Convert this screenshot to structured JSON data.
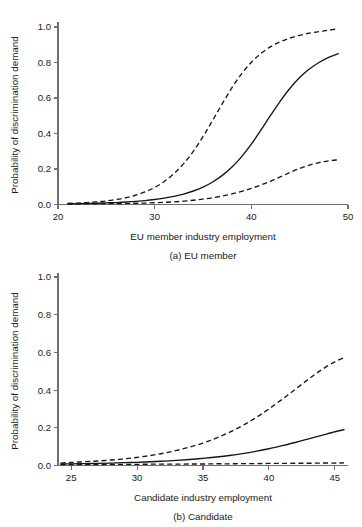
{
  "figure": {
    "panels": [
      {
        "id": "a",
        "subcaption": "(a) EU member",
        "xlabel": "EU member industry employment",
        "ylabel": "Probability of discrimination demand",
        "xticks": [
          "20",
          "30",
          "40",
          "50"
        ],
        "yticks": [
          "0.0",
          "0.2",
          "0.4",
          "0.6",
          "0.8",
          "1.0"
        ]
      },
      {
        "id": "b",
        "subcaption": "(b) Candidate",
        "xlabel": "Candidate industry employment",
        "ylabel": "Probability of discrimination demand",
        "xticks": [
          "25",
          "30",
          "35",
          "40",
          "45"
        ],
        "yticks": [
          "0.0",
          "0.2",
          "0.4",
          "0.6",
          "0.8",
          "1.0"
        ]
      }
    ],
    "footnote": ""
  },
  "chart_data": [
    {
      "type": "line",
      "panel": "a",
      "title": "(a) EU member",
      "xlabel": "EU member industry employment",
      "ylabel": "Probability of discrimination demand",
      "xlim": [
        20,
        50
      ],
      "ylim": [
        0.0,
        1.0
      ],
      "xticks": [
        20,
        30,
        40,
        50
      ],
      "yticks": [
        0.0,
        0.2,
        0.4,
        0.6,
        0.8,
        1.0
      ],
      "grid": false,
      "legend": null,
      "x": [
        21,
        22,
        23,
        24,
        25,
        26,
        27,
        28,
        29,
        30,
        31,
        32,
        33,
        34,
        35,
        36,
        37,
        38,
        39,
        40,
        41,
        42,
        43,
        44,
        45,
        46,
        47,
        48,
        49
      ],
      "series": [
        {
          "name": "Predicted probability",
          "style": "solid",
          "values": [
            0.004,
            0.005,
            0.006,
            0.007,
            0.009,
            0.011,
            0.014,
            0.018,
            0.022,
            0.028,
            0.036,
            0.046,
            0.059,
            0.076,
            0.098,
            0.127,
            0.164,
            0.211,
            0.27,
            0.34,
            0.42,
            0.503,
            0.583,
            0.655,
            0.715,
            0.763,
            0.8,
            0.829,
            0.85
          ]
        },
        {
          "name": "Upper 95% confidence bound",
          "style": "dashed",
          "values": [
            0.006,
            0.008,
            0.011,
            0.015,
            0.02,
            0.028,
            0.038,
            0.052,
            0.071,
            0.096,
            0.13,
            0.174,
            0.23,
            0.299,
            0.382,
            0.474,
            0.568,
            0.658,
            0.737,
            0.801,
            0.851,
            0.889,
            0.917,
            0.938,
            0.953,
            0.965,
            0.974,
            0.982,
            0.99
          ]
        },
        {
          "name": "Lower 95% confidence bound",
          "style": "dashed",
          "values": [
            0.003,
            0.003,
            0.004,
            0.004,
            0.005,
            0.005,
            0.006,
            0.007,
            0.008,
            0.01,
            0.012,
            0.015,
            0.019,
            0.024,
            0.03,
            0.038,
            0.048,
            0.06,
            0.074,
            0.091,
            0.11,
            0.132,
            0.156,
            0.18,
            0.203,
            0.222,
            0.236,
            0.246,
            0.252
          ]
        }
      ]
    },
    {
      "type": "line",
      "panel": "b",
      "title": "(b) Candidate",
      "xlabel": "Candidate industry employment",
      "ylabel": "Probability of discrimination demand",
      "xlim": [
        24,
        46
      ],
      "ylim": [
        0.0,
        1.0
      ],
      "xticks": [
        25,
        30,
        35,
        40,
        45
      ],
      "yticks": [
        0.0,
        0.2,
        0.4,
        0.6,
        0.8,
        1.0
      ],
      "grid": false,
      "legend": null,
      "x": [
        24.2,
        25,
        26,
        27,
        28,
        29,
        30,
        31,
        32,
        33,
        34,
        35,
        36,
        37,
        38,
        39,
        40,
        41,
        42,
        43,
        44,
        45,
        45.7
      ],
      "series": [
        {
          "name": "Predicted probability",
          "style": "solid",
          "values": [
            0.008,
            0.009,
            0.01,
            0.011,
            0.013,
            0.015,
            0.017,
            0.02,
            0.023,
            0.027,
            0.032,
            0.038,
            0.045,
            0.053,
            0.063,
            0.075,
            0.089,
            0.105,
            0.122,
            0.141,
            0.16,
            0.179,
            0.19
          ]
        },
        {
          "name": "Upper 95% confidence bound",
          "style": "dashed",
          "values": [
            0.013,
            0.016,
            0.02,
            0.024,
            0.029,
            0.035,
            0.043,
            0.053,
            0.065,
            0.08,
            0.098,
            0.119,
            0.145,
            0.176,
            0.212,
            0.253,
            0.3,
            0.351,
            0.404,
            0.458,
            0.508,
            0.55,
            0.572
          ]
        },
        {
          "name": "Lower 95% confidence bound",
          "style": "dashed",
          "values": [
            0.005,
            0.005,
            0.005,
            0.005,
            0.006,
            0.006,
            0.006,
            0.007,
            0.007,
            0.007,
            0.008,
            0.008,
            0.009,
            0.009,
            0.01,
            0.01,
            0.011,
            0.011,
            0.012,
            0.012,
            0.013,
            0.013,
            0.014
          ]
        }
      ]
    }
  ]
}
